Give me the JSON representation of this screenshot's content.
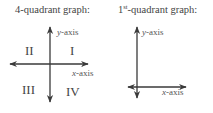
{
  "graphs": [
    {
      "title": "4-quadrant graph:",
      "y_label_var": "y",
      "y_label_suffix": "-axis",
      "x_label_var": "x",
      "x_label_suffix": "-axis",
      "quadrants": [
        "I",
        "II",
        "III",
        "IV"
      ]
    },
    {
      "title_prefix": "1",
      "title_sup": "st",
      "title_suffix": "-quadrant graph:",
      "y_label_var": "y",
      "y_label_suffix": "-axis",
      "x_label_var": "x",
      "x_label_suffix": "-axis"
    }
  ],
  "colors": {
    "axis": "#3a3a3a",
    "text": "#444444"
  }
}
